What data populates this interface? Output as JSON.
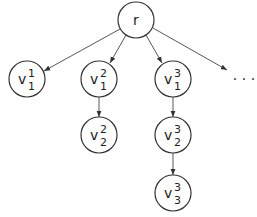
{
  "diagram": {
    "type": "tree",
    "colors": {
      "stroke": "#333333",
      "text": "#222222",
      "background": "#ffffff"
    },
    "nodes": [
      {
        "id": "r",
        "label": "r",
        "sup": "",
        "sub": "",
        "cx": 136,
        "cy": 20
      },
      {
        "id": "v1_1",
        "label": "v",
        "sup": "1",
        "sub": "1",
        "cx": 27,
        "cy": 79
      },
      {
        "id": "v2_1",
        "label": "v",
        "sup": "2",
        "sub": "1",
        "cx": 99,
        "cy": 79
      },
      {
        "id": "v3_1",
        "label": "v",
        "sup": "3",
        "sub": "1",
        "cx": 173,
        "cy": 79
      },
      {
        "id": "v2_2",
        "label": "v",
        "sup": "2",
        "sub": "2",
        "cx": 99,
        "cy": 135
      },
      {
        "id": "v3_2",
        "label": "v",
        "sup": "3",
        "sub": "2",
        "cx": 173,
        "cy": 135
      },
      {
        "id": "v3_3",
        "label": "v",
        "sup": "3",
        "sub": "3",
        "cx": 173,
        "cy": 193
      }
    ],
    "edges": [
      {
        "from": "r",
        "to": "v1_1"
      },
      {
        "from": "r",
        "to": "v2_1"
      },
      {
        "from": "r",
        "to": "v3_1"
      },
      {
        "from": "r",
        "to": "ellipsis"
      },
      {
        "from": "v2_1",
        "to": "v2_2"
      },
      {
        "from": "v3_1",
        "to": "v3_2"
      },
      {
        "from": "v3_2",
        "to": "v3_3"
      }
    ],
    "ellipsis": {
      "text": "· · ·"
    }
  }
}
